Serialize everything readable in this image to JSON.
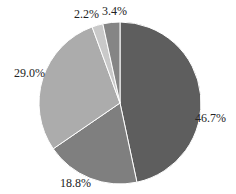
{
  "chart_data": {
    "type": "pie",
    "title": "",
    "categories": [
      "A",
      "B",
      "C",
      "D",
      "E"
    ],
    "values": [
      46.7,
      18.8,
      29.0,
      2.2,
      3.4
    ],
    "labels": [
      "46.7%",
      "18.8%",
      "29.0%",
      "2.2%",
      "3.4%"
    ],
    "colors": [
      "#5e5e5e",
      "#7f7f7f",
      "#acacac",
      "#c9c9c9",
      "#858585"
    ],
    "start_angle": "12 o'clock, clockwise",
    "legend": "none"
  }
}
